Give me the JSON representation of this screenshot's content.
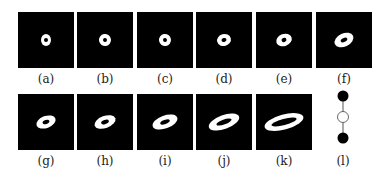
{
  "figure": {
    "panels": [
      {
        "label": "(a)",
        "rx": 5,
        "ry": 6,
        "rot": 0,
        "hole_rx": 2,
        "hole_ry": 2
      },
      {
        "label": "(b)",
        "rx": 6,
        "ry": 6,
        "rot": -10,
        "hole_rx": 2,
        "hole_ry": 2
      },
      {
        "label": "(c)",
        "rx": 6,
        "ry": 6,
        "rot": -10,
        "hole_rx": 2,
        "hole_ry": 2
      },
      {
        "label": "(d)",
        "rx": 7,
        "ry": 6,
        "rot": -15,
        "hole_rx": 2.5,
        "hole_ry": 2
      },
      {
        "label": "(e)",
        "rx": 8,
        "ry": 6,
        "rot": -20,
        "hole_rx": 2.5,
        "hole_ry": 2
      },
      {
        "label": "(f)",
        "rx": 10,
        "ry": 6.5,
        "rot": -25,
        "hole_rx": 3.5,
        "hole_ry": 2
      },
      {
        "label": "(g)",
        "rx": 10,
        "ry": 6,
        "rot": -20,
        "hole_rx": 3.5,
        "hole_ry": 2
      },
      {
        "label": "(h)",
        "rx": 11,
        "ry": 6,
        "rot": -20,
        "hole_rx": 4,
        "hole_ry": 2
      },
      {
        "label": "(i)",
        "rx": 13,
        "ry": 6.5,
        "rot": -20,
        "hole_rx": 5,
        "hole_ry": 2
      },
      {
        "label": "(j)",
        "rx": 16,
        "ry": 7,
        "rot": -20,
        "hole_rx": 8,
        "hole_ry": 2.5
      },
      {
        "label": "(k)",
        "rx": 20,
        "ry": 7.5,
        "rot": -15,
        "hole_rx": 13,
        "hole_ry": 3
      }
    ],
    "graph_label": "(l)",
    "graph_nodes": [
      "filled",
      "empty",
      "filled"
    ]
  }
}
